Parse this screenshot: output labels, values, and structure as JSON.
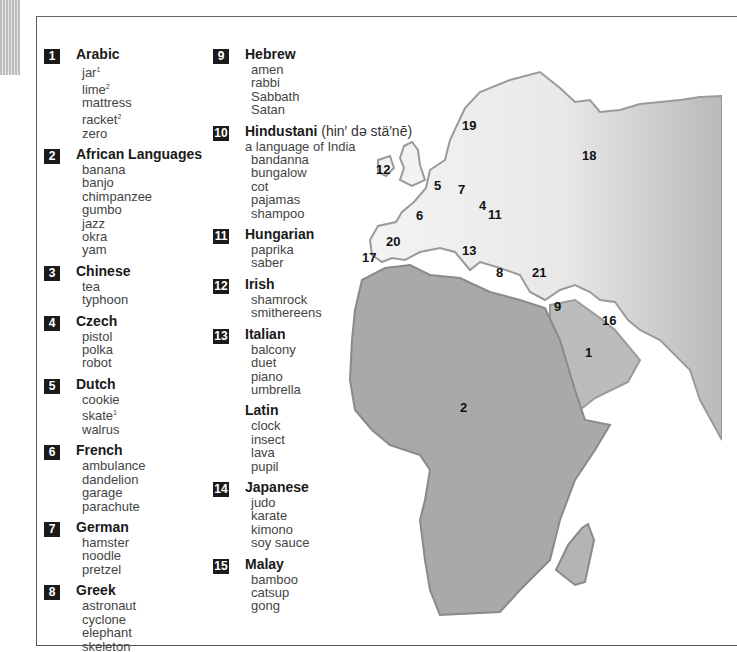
{
  "entries": [
    {
      "num": "1",
      "lang": "Arabic",
      "words": [
        "jar",
        "lime",
        "mattress",
        "racket",
        "zero"
      ],
      "sups": [
        "1",
        "2",
        "",
        "2",
        ""
      ]
    },
    {
      "num": "2",
      "lang": "African Languages",
      "words": [
        "banana",
        "banjo",
        "chimpanzee",
        "gumbo",
        "jazz",
        "okra",
        "yam"
      ]
    },
    {
      "num": "3",
      "lang": "Chinese",
      "words": [
        "tea",
        "typhoon"
      ]
    },
    {
      "num": "4",
      "lang": "Czech",
      "words": [
        "pistol",
        "polka",
        "robot"
      ]
    },
    {
      "num": "5",
      "lang": "Dutch",
      "words": [
        "cookie",
        "skate",
        "walrus"
      ],
      "sups": [
        "",
        "1",
        ""
      ]
    },
    {
      "num": "6",
      "lang": "French",
      "words": [
        "ambulance",
        "dandelion",
        "garage",
        "parachute"
      ]
    },
    {
      "num": "7",
      "lang": "German",
      "words": [
        "hamster",
        "noodle",
        "pretzel"
      ]
    },
    {
      "num": "8",
      "lang": "Greek",
      "words": [
        "astronaut",
        "cyclone",
        "elephant",
        "skeleton"
      ]
    },
    {
      "num": "9",
      "lang": "Hebrew",
      "words": [
        "amen",
        "rabbi",
        "Sabbath",
        "Satan"
      ]
    },
    {
      "num": "10",
      "lang": "Hindustani",
      "pron": "(hin′ də stä′nē)",
      "sub": "a language of India",
      "words": [
        "bandanna",
        "bungalow",
        "cot",
        "pajamas",
        "shampoo"
      ]
    },
    {
      "num": "11",
      "lang": "Hungarian",
      "words": [
        "paprika",
        "saber"
      ]
    },
    {
      "num": "12",
      "lang": "Irish",
      "words": [
        "shamrock",
        "smithereens"
      ]
    },
    {
      "num": "13",
      "lang": "Italian",
      "words": [
        "balcony",
        "duet",
        "piano",
        "umbrella"
      ]
    },
    {
      "num": "",
      "lang": "Latin",
      "words": [
        "clock",
        "insect",
        "lava",
        "pupil"
      ]
    },
    {
      "num": "14",
      "lang": "Japanese",
      "words": [
        "judo",
        "karate",
        "kimono",
        "soy sauce"
      ]
    },
    {
      "num": "15",
      "lang": "Malay",
      "words": [
        "bamboo",
        "catsup",
        "gong"
      ]
    }
  ],
  "map_labels": [
    {
      "text": "19",
      "x": 462,
      "y": 120
    },
    {
      "text": "18",
      "x": 582,
      "y": 148
    },
    {
      "text": "12",
      "x": 376,
      "y": 162
    },
    {
      "text": "5",
      "x": 434,
      "y": 178
    },
    {
      "text": "7",
      "x": 458,
      "y": 182
    },
    {
      "text": "4",
      "x": 479,
      "y": 198
    },
    {
      "text": "11",
      "x": 488,
      "y": 207
    },
    {
      "text": "6",
      "x": 416,
      "y": 208
    },
    {
      "text": "20",
      "x": 386,
      "y": 234
    },
    {
      "text": "17",
      "x": 362,
      "y": 250
    },
    {
      "text": "13",
      "x": 462,
      "y": 243
    },
    {
      "text": "8",
      "x": 496,
      "y": 265
    },
    {
      "text": "21",
      "x": 532,
      "y": 265
    },
    {
      "text": "9",
      "x": 554,
      "y": 299
    },
    {
      "text": "16",
      "x": 602,
      "y": 313
    },
    {
      "text": "1",
      "x": 585,
      "y": 345
    },
    {
      "text": "2",
      "x": 460,
      "y": 400
    }
  ]
}
